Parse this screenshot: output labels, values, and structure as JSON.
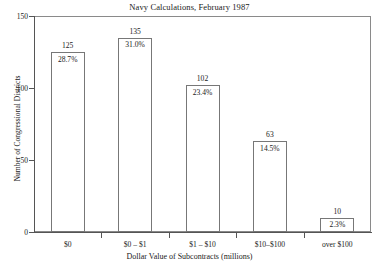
{
  "chart_data": {
    "type": "bar",
    "title": "Navy Calculations, February 1987",
    "xlabel": "Dollar Value of Subcontracts (millions)",
    "ylabel": "Number of Congressional Districts",
    "categories": [
      "$0",
      "$0 – $1",
      "$1 – $10",
      "$10–$100",
      "over $100"
    ],
    "values": [
      125,
      135,
      102,
      63,
      10
    ],
    "value_labels": [
      "125",
      "135",
      "102",
      "63",
      "10"
    ],
    "percent_labels": [
      "28.7%",
      "31.0%",
      "23.4%",
      "14.5%",
      "2.3%"
    ],
    "percents": [
      28.7,
      31.0,
      23.4,
      14.5,
      2.3
    ],
    "ylim": [
      0,
      150
    ],
    "yticks": [
      0,
      50,
      100,
      150
    ],
    "ytick_labels": [
      "0",
      "50",
      "100",
      "150"
    ],
    "grid": false,
    "legend": "none",
    "bar_face_color": "#ffffff",
    "bar_edge_color": "#777777",
    "axis_color": "#555555",
    "text_color": "#1a1a1a"
  }
}
